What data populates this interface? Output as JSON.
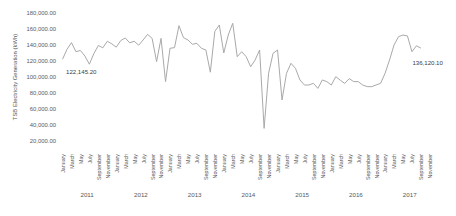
{
  "chart_data": {
    "type": "line",
    "title": "",
    "xlabel": "",
    "ylabel": "TSB Electricity Generation (kWh)",
    "ylim": [
      20000,
      180000
    ],
    "ytick_step": 20000,
    "y_tick_labels": [
      "180,000.00",
      "160,000.00",
      "140,000.00",
      "120,000.00",
      "100,000.00",
      "80,000.00",
      "60,000.00",
      "40,000.00",
      "20,000.00"
    ],
    "grid": false,
    "legend": false,
    "x_start": "January 2011",
    "x_end": "September 2017",
    "years": [
      "2011",
      "2012",
      "2013",
      "2014",
      "2015",
      "2016",
      "2017"
    ],
    "month_tick_labels": [
      "January",
      "March",
      "May",
      "July",
      "September",
      "November"
    ],
    "series": [
      {
        "name": "TSB Electricity Generation",
        "color": "#a9a9a9",
        "values": [
          122145.2,
          134500,
          143000,
          131600,
          133200,
          126200,
          116000,
          129200,
          139400,
          136500,
          144700,
          141500,
          137300,
          145500,
          148800,
          142700,
          144700,
          139800,
          146300,
          153300,
          148300,
          119200,
          148300,
          94200,
          135900,
          136700,
          164100,
          149200,
          146300,
          140900,
          142100,
          135900,
          133800,
          106000,
          157000,
          165000,
          130000,
          152500,
          167100,
          125400,
          131600,
          125400,
          112900,
          121300,
          133800,
          35800,
          104600,
          129600,
          133800,
          71300,
          104600,
          117100,
          110800,
          96300,
          90000,
          90000,
          92100,
          85800,
          96300,
          94200,
          90000,
          100400,
          96000,
          92000,
          98000,
          94200,
          94200,
          90000,
          88000,
          87900,
          90000,
          92100,
          104600,
          121300,
          140000,
          150400,
          152500,
          151300,
          131600,
          139000,
          136120.1
        ]
      }
    ],
    "annotations": [
      {
        "text": "122,145.20",
        "point_index": 0,
        "position": "below-right"
      },
      {
        "text": "136,120.10",
        "point_index": 80,
        "position": "below-right"
      }
    ],
    "colors": {
      "line": "#a9a9a9",
      "axis_text": "#595959",
      "annotation_text": "#404040",
      "background": "#ffffff"
    }
  }
}
